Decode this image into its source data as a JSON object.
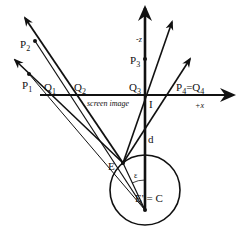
{
  "diagram": {
    "type": "perspective-projection",
    "colors": {
      "ink": "#111111",
      "background": "#ffffff"
    },
    "axes": {
      "x_label": "+x",
      "z_label": "-z"
    },
    "screen_label": "screen image",
    "points": {
      "P1": {
        "label": "P",
        "sub": "1"
      },
      "P2": {
        "label": "P",
        "sub": "2"
      },
      "P3": {
        "label": "P",
        "sub": "3"
      },
      "P4Q4": {
        "label": "P",
        "sub": "4",
        "eq": "=Q",
        "sub2": "4"
      },
      "Q1": {
        "label": "Q",
        "sub": "1"
      },
      "Q2": {
        "label": "Q",
        "sub": "2"
      },
      "Q3": {
        "label": "Q",
        "sub": "3"
      },
      "I": {
        "label": "I"
      },
      "E": {
        "label": "E"
      },
      "EC": {
        "label": "E' = C"
      },
      "d": {
        "label": "d"
      },
      "epsilon": {
        "label": "ε"
      }
    }
  }
}
